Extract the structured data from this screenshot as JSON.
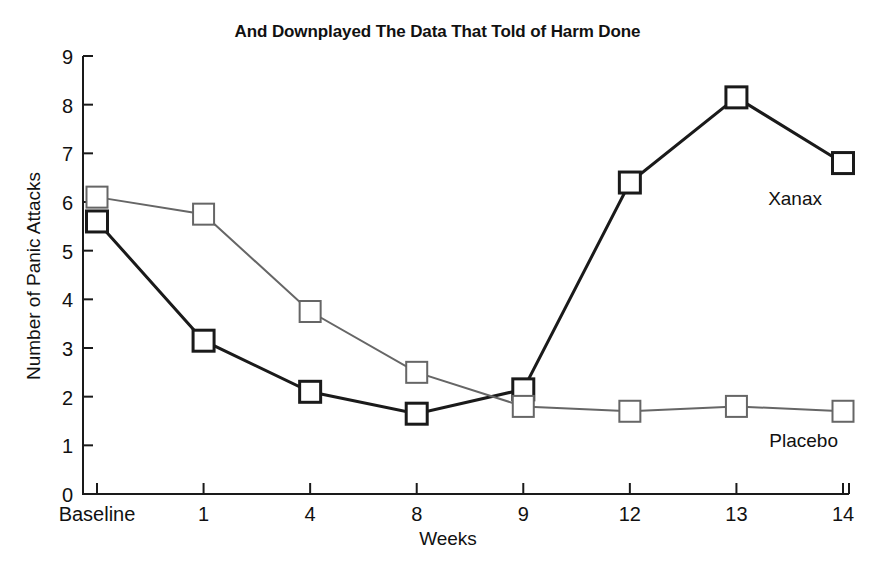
{
  "chart_data": {
    "type": "line",
    "title": "And Downplayed The Data That Told of Harm Done",
    "xlabel": "Weeks",
    "ylabel": "Number of Panic Attacks",
    "categories": [
      "Baseline",
      "1",
      "4",
      "8",
      "9",
      "12",
      "13",
      "14"
    ],
    "ylim": [
      0,
      9
    ],
    "yticks": [
      "0",
      "1",
      "2",
      "3",
      "4",
      "5",
      "6",
      "7",
      "8",
      "9"
    ],
    "grid": false,
    "legend_position": "inline-right",
    "series": [
      {
        "name": "Xanax",
        "color": "#1a1a1a",
        "marker": "square",
        "values": [
          5.6,
          3.15,
          2.1,
          1.65,
          2.15,
          6.4,
          8.15,
          6.8
        ]
      },
      {
        "name": "Placebo",
        "color": "#666666",
        "marker": "square",
        "values": [
          6.1,
          5.75,
          3.75,
          2.5,
          1.8,
          1.7,
          1.8,
          1.7
        ]
      }
    ],
    "annotations": [
      {
        "text": "Xanax",
        "series": "Xanax"
      },
      {
        "text": "Placebo",
        "series": "Placebo"
      }
    ]
  }
}
